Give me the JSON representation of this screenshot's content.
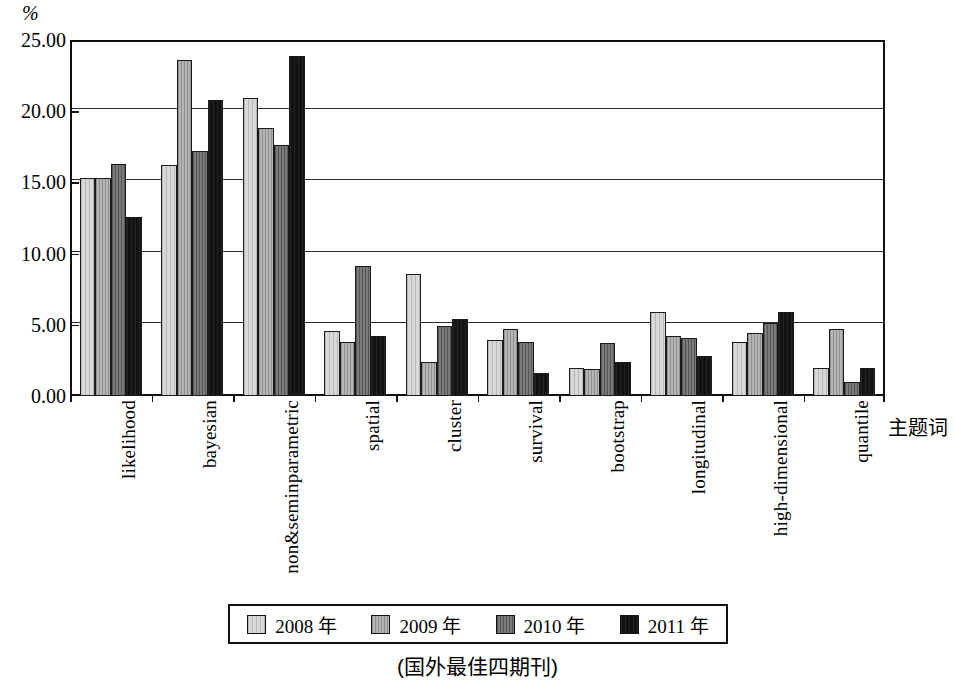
{
  "chart_data": {
    "type": "bar",
    "title": "",
    "subtitle": "",
    "unit_label": "%",
    "xlabel": "主题词",
    "ylabel": "",
    "ylim": [
      0,
      25
    ],
    "ytick_labels": [
      "0.00",
      "5.00",
      "10.00",
      "15.00",
      "20.00",
      "25.00"
    ],
    "ytick_values": [
      0,
      5,
      10,
      15,
      20,
      25
    ],
    "grid": true,
    "legend_position": "bottom",
    "categories": [
      "likelihood",
      "bayesian",
      "non&seminparametric",
      "spatial",
      "cluster",
      "survival",
      "bootstrap",
      "longitudinal",
      "high-dimensional",
      "quantile"
    ],
    "series": [
      {
        "name": "2008 年",
        "color": "#d8d8d8",
        "values": [
          15.3,
          16.2,
          20.9,
          4.6,
          8.6,
          3.9,
          2.0,
          5.9,
          3.8,
          2.0
        ]
      },
      {
        "name": "2009 年",
        "color": "#b4b4b4",
        "values": [
          15.3,
          23.6,
          18.8,
          3.8,
          2.4,
          4.7,
          1.9,
          4.2,
          4.4,
          4.7
        ]
      },
      {
        "name": "2010 年",
        "color": "#7a7a7a",
        "values": [
          16.3,
          17.2,
          17.6,
          9.1,
          4.9,
          3.8,
          3.7,
          4.1,
          5.1,
          1.0
        ]
      },
      {
        "name": "2011 年",
        "color": "#121212",
        "values": [
          12.6,
          20.8,
          23.9,
          4.2,
          5.4,
          1.6,
          2.4,
          2.8,
          5.9,
          2.0
        ]
      }
    ],
    "caption": "(国外最佳四期刊)"
  }
}
